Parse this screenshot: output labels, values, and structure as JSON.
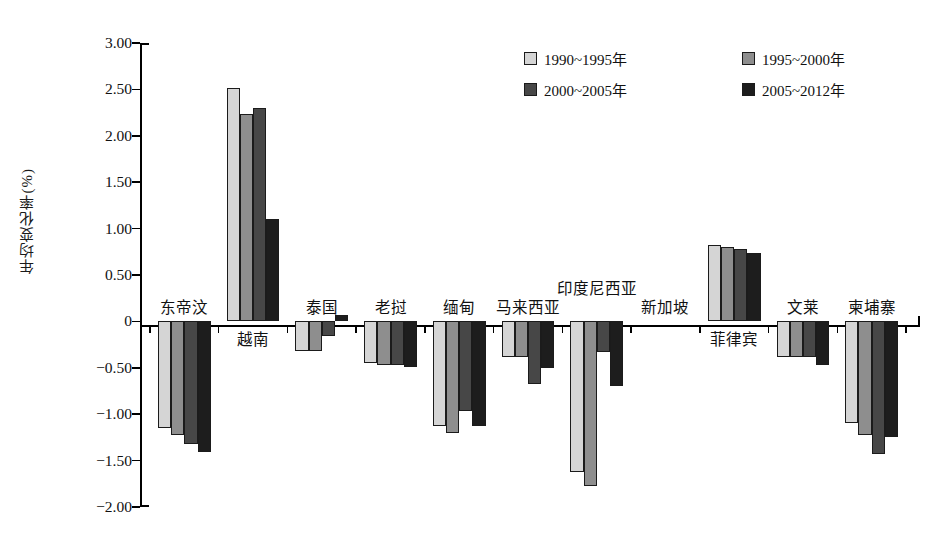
{
  "chart_data": {
    "type": "bar",
    "title": "",
    "xlabel": "",
    "ylabel": "年均变化率(%)",
    "ylim": [
      -2.0,
      3.0
    ],
    "ytick_labels": [
      "3.00",
      "2.50",
      "2.00",
      "1.50",
      "1.00",
      "0.50",
      "0",
      "-0.50",
      "-1.00",
      "-1.50",
      "-2.00"
    ],
    "ytick_values": [
      3.0,
      2.5,
      2.0,
      1.5,
      1.0,
      0.5,
      0,
      -0.5,
      -1.0,
      -1.5,
      -2.0
    ],
    "grid": false,
    "legend_position": "top-right",
    "categories": [
      "东帝汶",
      "越南",
      "泰国",
      "老挝",
      "缅甸",
      "马来西亚",
      "印度尼西亚",
      "新加坡",
      "菲律宾",
      "文莱",
      "柬埔寨"
    ],
    "series": [
      {
        "name": "1990~1995年",
        "color": "#d5d5d5",
        "values": [
          -1.15,
          2.52,
          -0.32,
          -0.45,
          -1.13,
          -0.38,
          -1.62,
          0.0,
          0.82,
          -0.38,
          -1.1
        ]
      },
      {
        "name": "1995~2000年",
        "color": "#8e8e8e",
        "values": [
          -1.22,
          2.24,
          -0.32,
          -0.47,
          -1.2,
          -0.38,
          -1.77,
          0.0,
          0.8,
          -0.38,
          -1.22
        ]
      },
      {
        "name": "2000~2005年",
        "color": "#474747",
        "values": [
          -1.32,
          2.3,
          -0.16,
          -0.47,
          -0.97,
          -0.68,
          -0.33,
          0.0,
          0.78,
          -0.38,
          -1.43
        ]
      },
      {
        "name": "2005~2012年",
        "color": "#1d1d1d",
        "values": [
          -1.41,
          1.1,
          0.07,
          -0.49,
          -1.13,
          -0.5,
          -0.7,
          0.0,
          0.74,
          -0.47,
          -1.25
        ]
      }
    ]
  },
  "legend": {
    "items": [
      {
        "label": "1990~1995年",
        "color": "#d5d5d5"
      },
      {
        "label": "1995~2000年",
        "color": "#8e8e8e"
      },
      {
        "label": "2000~2005年",
        "color": "#474747"
      },
      {
        "label": "2005~2012年",
        "color": "#1d1d1d"
      }
    ]
  },
  "axis": {
    "y_title": "年均变化率(%)"
  }
}
